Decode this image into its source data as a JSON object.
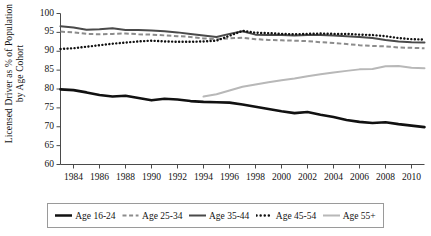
{
  "axes": {
    "ylabel": "Licensed Driver as % of Population by Age Cohort",
    "yticks": [
      "100",
      "95",
      "90",
      "85",
      "80",
      "75",
      "70",
      "65",
      "60"
    ],
    "xticks": [
      "1984",
      "1986",
      "1988",
      "1990",
      "1992",
      "1994",
      "1996",
      "1998",
      "2000",
      "2002",
      "2004",
      "2006",
      "2008",
      "2010"
    ]
  },
  "legend": {
    "items": [
      {
        "label": "Age 16-24",
        "style": "solid-thick",
        "color": "#111111"
      },
      {
        "label": "Age 25-34",
        "style": "dashed",
        "color": "#8c8c8c"
      },
      {
        "label": "Age 35-44",
        "style": "solid",
        "color": "#4a4a4a"
      },
      {
        "label": "Age 45-54",
        "style": "dotted",
        "color": "#111111"
      },
      {
        "label": "Age 55+",
        "style": "solid-light",
        "color": "#b8b8b8"
      }
    ]
  },
  "chart_data": {
    "type": "line",
    "title": "",
    "xlabel": "",
    "ylabel": "Licensed Driver as % of Population by Age Cohort",
    "xlim": [
      1983,
      2011
    ],
    "ylim": [
      60,
      100
    ],
    "grid": false,
    "legend_position": "bottom",
    "x": [
      1983,
      1984,
      1985,
      1986,
      1987,
      1988,
      1989,
      1990,
      1991,
      1992,
      1993,
      1994,
      1995,
      1996,
      1997,
      1998,
      1999,
      2000,
      2001,
      2002,
      2003,
      2004,
      2005,
      2006,
      2007,
      2008,
      2009,
      2010,
      2011
    ],
    "series": [
      {
        "name": "Age 16-24",
        "color": "#111111",
        "style": "solid-thick",
        "values": [
          79.9,
          79.7,
          79.1,
          78.4,
          78.0,
          78.2,
          77.6,
          77.0,
          77.4,
          77.2,
          76.8,
          76.6,
          76.5,
          76.4,
          75.9,
          75.3,
          74.7,
          74.1,
          73.6,
          73.9,
          73.2,
          72.6,
          71.8,
          71.3,
          71.0,
          71.2,
          70.7,
          70.3,
          69.9
        ]
      },
      {
        "name": "Age 25-34",
        "color": "#8c8c8c",
        "style": "dashed",
        "values": [
          95.2,
          95.0,
          94.6,
          94.5,
          94.6,
          94.7,
          94.5,
          94.4,
          94.2,
          94.0,
          93.8,
          93.4,
          93.2,
          93.4,
          93.6,
          93.2,
          93.0,
          92.9,
          92.8,
          92.7,
          92.4,
          92.2,
          91.9,
          91.6,
          91.4,
          91.3,
          91.0,
          90.9,
          90.8
        ]
      },
      {
        "name": "Age 35-44",
        "color": "#4a4a4a",
        "style": "solid",
        "values": [
          96.6,
          96.3,
          95.7,
          95.8,
          96.1,
          95.6,
          95.6,
          95.5,
          95.3,
          95.0,
          94.6,
          94.2,
          93.8,
          94.6,
          95.3,
          94.4,
          94.3,
          94.3,
          94.2,
          94.3,
          94.3,
          94.2,
          94.0,
          93.8,
          93.5,
          93.0,
          92.6,
          92.4,
          92.3
        ]
      },
      {
        "name": "Age 45-54",
        "color": "#111111",
        "style": "dotted",
        "values": [
          90.6,
          90.8,
          91.2,
          91.6,
          92.0,
          92.3,
          92.6,
          92.8,
          92.6,
          92.5,
          92.5,
          92.6,
          92.8,
          94.1,
          95.4,
          94.9,
          94.8,
          94.6,
          94.5,
          94.6,
          94.7,
          94.6,
          94.6,
          94.4,
          94.3,
          94.0,
          93.5,
          93.2,
          93.1
        ]
      },
      {
        "name": "Age 55+",
        "color": "#b8b8b8",
        "style": "solid-light",
        "values": [
          null,
          null,
          null,
          null,
          null,
          null,
          null,
          null,
          null,
          null,
          null,
          78.0,
          78.6,
          79.6,
          80.6,
          81.2,
          81.8,
          82.3,
          82.8,
          83.4,
          83.9,
          84.4,
          84.8,
          85.2,
          85.3,
          86.0,
          86.1,
          85.6,
          85.5
        ]
      }
    ]
  }
}
